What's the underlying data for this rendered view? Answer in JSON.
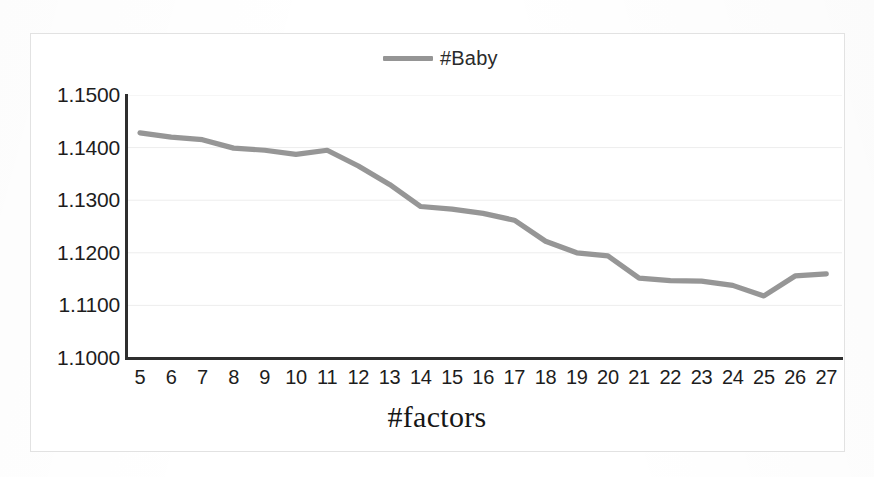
{
  "chart_data": {
    "type": "line",
    "title": "",
    "xlabel": "#factors",
    "ylabel": "",
    "legend_position": "top-center",
    "grid": true,
    "xlim": [
      5,
      27
    ],
    "ylim": [
      1.1,
      1.15
    ],
    "ytick_labels": [
      "1.1500",
      "1.1400",
      "1.1300",
      "1.1200",
      "1.1100",
      "1.1000"
    ],
    "ytick_values": [
      1.15,
      1.14,
      1.13,
      1.12,
      1.11,
      1.1
    ],
    "xtick_labels": [
      "5",
      "6",
      "7",
      "8",
      "9",
      "10",
      "11",
      "12",
      "13",
      "14",
      "15",
      "16",
      "17",
      "18",
      "19",
      "20",
      "21",
      "22",
      "23",
      "24",
      "25",
      "26",
      "27"
    ],
    "categories": [
      5,
      6,
      7,
      8,
      9,
      10,
      11,
      12,
      13,
      14,
      15,
      16,
      17,
      18,
      19,
      20,
      21,
      22,
      23,
      24,
      25,
      26,
      27
    ],
    "series": [
      {
        "name": "#Baby",
        "color": "#8d8d8d",
        "values": [
          1.1428,
          1.142,
          1.1415,
          1.1399,
          1.1395,
          1.1387,
          1.1395,
          1.1365,
          1.133,
          1.1288,
          1.1283,
          1.1275,
          1.1262,
          1.1222,
          1.12,
          1.1194,
          1.1152,
          1.1147,
          1.1146,
          1.1138,
          1.1118,
          1.1156,
          1.116
        ]
      }
    ]
  },
  "legend": {
    "entries": [
      {
        "label": "#Baby",
        "color": "#8d8d8d"
      }
    ]
  },
  "axis": {
    "x_title": "#factors"
  },
  "colors": {
    "line": "#8d8d8d",
    "axis": "#2f2f2f",
    "grid": "#ededed",
    "text": "#1d1d1d",
    "frame": "#e2e2e2"
  }
}
